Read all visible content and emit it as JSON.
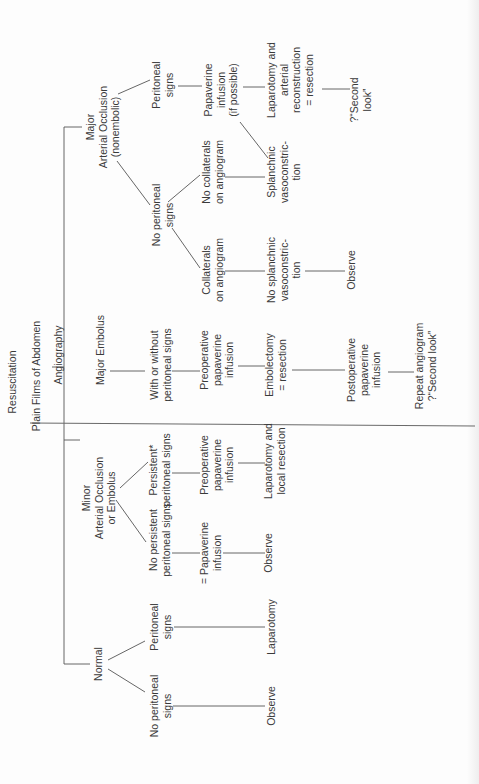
{
  "diagram": {
    "orientation": "rotated-90-ccw",
    "root": "Resuscitation",
    "step2": "Plain Films of Abdomen",
    "step3": "Angiography",
    "nodes": {
      "resuscitation": [
        "Resuscitation"
      ],
      "plain_films": [
        "Plain Films of Abdomen"
      ],
      "angiography": [
        "Angiography"
      ],
      "normal": [
        "Normal"
      ],
      "normal_peritoneal": [
        "Peritoneal",
        "signs"
      ],
      "normal_no_peritoneal": [
        "No peritoneal",
        "signs"
      ],
      "normal_laparotomy": [
        "Laparotomy"
      ],
      "normal_observe": [
        "Observe"
      ],
      "minor": [
        "Minor",
        "Arterial Occlusion",
        "or Embolus"
      ],
      "minor_persistent": [
        "Persistent*",
        "peritoneal signs"
      ],
      "minor_no_persistent": [
        "No persistent",
        "peritoneal signs"
      ],
      "minor_preop_papaverine": [
        "Preoperative",
        "papaverine",
        "infusion"
      ],
      "minor_papaverine": [
        "= Papaverine",
        "infusion"
      ],
      "minor_laparotomy": [
        "Laparotomy and",
        "local resection"
      ],
      "minor_observe": [
        "Observe"
      ],
      "embolus": [
        "Major Embolus"
      ],
      "embolus_signs": [
        "With or without",
        "peritoneal signs"
      ],
      "embolus_preop": [
        "Preoperative",
        "papaverine",
        "infusion"
      ],
      "embolus_embolectomy": [
        "Embolectomy",
        "= resection"
      ],
      "embolus_postop": [
        "Postoperative",
        "papaverine",
        "infusion"
      ],
      "embolus_repeat": [
        "Repeat angiogram",
        "?“Second look”"
      ],
      "major": [
        "Major",
        "Arterial Occlusion",
        "(nonembolic)"
      ],
      "major_peritoneal": [
        "Peritoneal",
        "signs"
      ],
      "major_no_peritoneal": [
        "No peritoneal",
        "signs"
      ],
      "major_papaverine": [
        "Papaverine",
        "infusion",
        "(if possible)"
      ],
      "major_laparotomy": [
        "Laparotomy and",
        "arterial",
        "reconstruction",
        "= resection"
      ],
      "major_second_look": [
        "?“Second",
        "look”"
      ],
      "collaterals": [
        "Collaterals",
        "on angiogram"
      ],
      "no_collaterals": [
        "No collaterals",
        "on angiogram"
      ],
      "no_splanchnic": [
        "No splanchnic",
        "vasoconstric-",
        "tion"
      ],
      "splanchnic": [
        "Splanchnic",
        "vasoconstric-",
        "tion"
      ],
      "collaterals_observe": [
        "Observe"
      ]
    },
    "colors": {
      "text": "#3a3a3a",
      "lines": "#555555",
      "background": "#fdfdfd"
    }
  }
}
